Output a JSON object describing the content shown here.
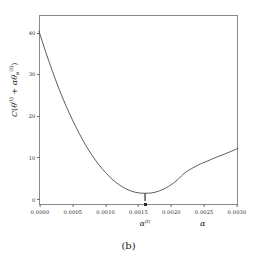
{
  "figure": {
    "caption": "(b)"
  },
  "axes": {
    "x_title": "α",
    "y_title_parts": {
      "c": "C",
      "open": "(",
      "theta": "θ",
      "theta_sup": "(t)",
      "plus": " + ",
      "alpha": "α",
      "theta2": "θ",
      "theta2_sub": "α",
      "theta2_sup": "(t)",
      "close": ")"
    },
    "y_title_plain": "C(θ⁽ᵗ⁾ + α θα⁽ᵗ⁾)",
    "x_ticks": [
      "0.0000",
      "0.0005",
      "0.0010",
      "0.0015",
      "0.0020",
      "0.0025",
      "0.0030"
    ],
    "y_ticks": [
      "40",
      "30",
      "20",
      "10",
      "0"
    ],
    "frame_color": "#8a8a8a",
    "curve_color": "#4a4a4a",
    "marker_color": "#7a7a7a"
  },
  "annotations": {
    "alpha_t_label": "α",
    "alpha_t_sup": "(t)"
  },
  "chart_data": {
    "type": "line",
    "title": "",
    "subtitle": "",
    "xlabel": "α",
    "ylabel": "C(θ^(t) + α θ_α^(t))",
    "xlim": [
      0.0,
      0.003
    ],
    "ylim": [
      -2.0,
      45.0
    ],
    "xticks": [
      0.0,
      0.0005,
      0.001,
      0.0015,
      0.002,
      0.0025,
      0.003
    ],
    "xticklabels": [
      "0.0000",
      "0.0005",
      "0.0010",
      "0.0015",
      "0.0020",
      "0.0025",
      "0.0030"
    ],
    "yticks": [
      0,
      10,
      20,
      30,
      40
    ],
    "yticklabels": [
      "0",
      "10",
      "20",
      "30",
      "40"
    ],
    "grid": false,
    "legend": null,
    "series": [
      {
        "name": "cost along search direction",
        "x": [
          0.0,
          0.0001,
          0.0002,
          0.0003,
          0.0004,
          0.0005,
          0.0006,
          0.0007,
          0.0008,
          0.0009,
          0.001,
          0.0011,
          0.0012,
          0.0013,
          0.0014,
          0.0015,
          0.0016,
          0.0017,
          0.0018,
          0.0019,
          0.002,
          0.0021,
          0.0022,
          0.0023,
          0.0024,
          0.0025,
          0.0026,
          0.0027,
          0.0028,
          0.0029,
          0.003
        ],
        "y": [
          41.0,
          35.9,
          31.2,
          26.8,
          22.8,
          19.2,
          15.9,
          12.9,
          10.3,
          8.0,
          6.1,
          4.4,
          3.1,
          2.1,
          1.4,
          1.0,
          0.9,
          1.0,
          1.4,
          2.1,
          3.1,
          4.4,
          6.0,
          7.0,
          7.9,
          8.6,
          9.3,
          10.0,
          10.6,
          11.3,
          12.0
        ]
      }
    ],
    "annotations": [
      {
        "label": "α^(t)",
        "x": 0.0016,
        "y": 0.9,
        "type": "minimum-marker",
        "description": "vertical drop line from curve minimum to x-axis"
      }
    ]
  }
}
